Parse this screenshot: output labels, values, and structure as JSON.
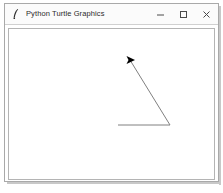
{
  "window": {
    "title": "Python Turtle Graphics",
    "icon": "python-feather-icon",
    "controls": {
      "minimize_label": "Minimize",
      "maximize_label": "Maximize",
      "close_label": "Close"
    }
  },
  "canvas": {
    "name": "turtle-drawing-canvas",
    "background_color": "#ffffff",
    "border_color": "#b4b4b4",
    "pen_color": "#808080",
    "turtle_color": "#000000",
    "width": 205,
    "height": 150,
    "drawing": {
      "description": "angle drawn by turtle: horizontal ray and diagonal ray meeting at a vertex",
      "paths": [
        {
          "name": "horizontal-ray",
          "points": [
            [
              109,
              96
            ],
            [
              161,
              96
            ]
          ]
        },
        {
          "name": "diagonal-ray",
          "points": [
            [
              161,
              96
            ],
            [
              121,
              31
            ]
          ]
        }
      ],
      "turtle": {
        "name": "turtle-cursor",
        "x": 121,
        "y": 31,
        "heading": 0,
        "shape": "arrow"
      }
    }
  }
}
